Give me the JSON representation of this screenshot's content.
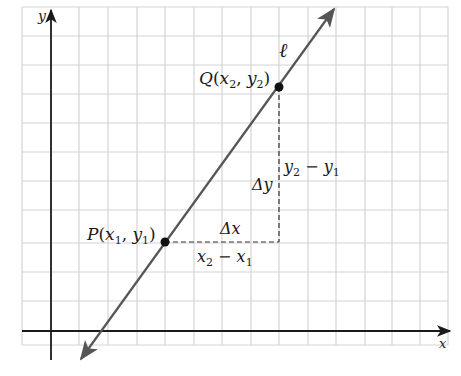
{
  "diagram": {
    "axes": {
      "x_label": "x",
      "y_label": "y"
    },
    "line": {
      "label": "ℓ",
      "color": "#555555"
    },
    "points": {
      "P": {
        "name": "P",
        "open": "(",
        "x": "x",
        "x_sub": "1",
        "comma": ", ",
        "y": "y",
        "y_sub": "1",
        "close": ")"
      },
      "Q": {
        "name": "Q",
        "open": "(",
        "x": "x",
        "x_sub": "2",
        "comma": ", ",
        "y": "y",
        "y_sub": "2",
        "close": ")"
      }
    },
    "delta_x": {
      "symbol": "Δx",
      "expr_a": "x",
      "expr_a_sub": "2",
      "minus": " − ",
      "expr_b": "x",
      "expr_b_sub": "1"
    },
    "delta_y": {
      "symbol": "Δy",
      "expr_a": "y",
      "expr_a_sub": "2",
      "minus": " − ",
      "expr_b": "y",
      "expr_b_sub": "1"
    },
    "colors": {
      "grid": "#d4d4d4",
      "axis": "#1a1a1a",
      "line": "#555555",
      "point": "#111111",
      "dashed": "#333333"
    }
  }
}
